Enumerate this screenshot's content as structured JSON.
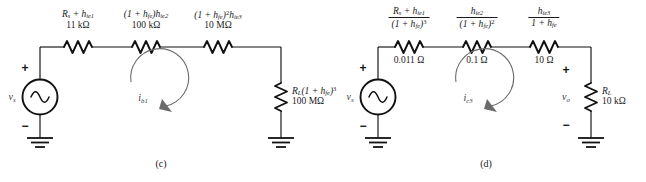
{
  "figure": {
    "panels": [
      {
        "id": "c",
        "caption": "(c)",
        "source": {
          "label_v": "v",
          "label_sub": "s",
          "plus": "+",
          "minus": "−"
        },
        "loop_current": {
          "sym": "i",
          "sub": "b1"
        },
        "series_components": [
          {
            "name": "rs-hie1",
            "expr_html": "R<sub>s</sub> + h<sub>ie1</sub>",
            "value": "11 kΩ"
          },
          {
            "name": "hie2-scaled",
            "expr_html": "(1 + h<sub>fe</sub>)h<sub>ie2</sub>",
            "value": "100 kΩ"
          },
          {
            "name": "hie3-scaled",
            "expr_html": "(1 + h<sub>fe</sub>)<sup>2</sup>h<sub>ie3</sub>",
            "value": "10 MΩ"
          }
        ],
        "load": {
          "name": "rl-scaled",
          "expr_html": "R<sub>L</sub>(1 + h<sub>fe</sub>)<sup>3</sup>",
          "value": "100 MΩ"
        }
      },
      {
        "id": "d",
        "caption": "(d)",
        "source": {
          "label_v": "v",
          "label_sub": "s",
          "plus": "+",
          "minus": "−"
        },
        "loop_current": {
          "sym": "i",
          "sub": "c3"
        },
        "output_voltage": {
          "sym": "v",
          "sub": "o",
          "plus": "+",
          "minus": "−"
        },
        "series_components": [
          {
            "name": "rs-hie1-over-hfe3",
            "num_html": "R<sub>s</sub> + h<sub>ie1</sub>",
            "den_html": "(1 + h<sub>fe</sub>)<sup>3</sup>",
            "value": "0.011 Ω"
          },
          {
            "name": "hie2-over-hfe2",
            "num_html": "h<sub>ie2</sub>",
            "den_html": "(1 + h<sub>fe</sub>)<sup>2</sup>",
            "value": "0.1 Ω"
          },
          {
            "name": "hie3-over-hfe",
            "num_html": "h<sub>ie3</sub>",
            "den_html": "1 + h<sub>fe</sub>",
            "value": "10 Ω"
          }
        ],
        "load": {
          "name": "rl",
          "expr_html": "R<sub>L</sub>",
          "value": "10 kΩ"
        }
      }
    ]
  },
  "colors": {
    "wire": "#111111",
    "annotation": "#6b6b6b",
    "text": "#1a1a1a",
    "background": "#ffffff"
  }
}
